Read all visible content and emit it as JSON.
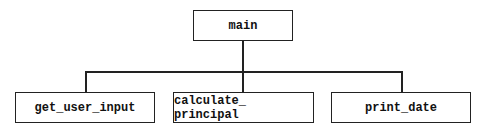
{
  "diagram": {
    "type": "structure-chart",
    "root": {
      "label": "main"
    },
    "children": [
      {
        "label": "get_user_input"
      },
      {
        "label": "calculate_ principal"
      },
      {
        "label": "print_date"
      }
    ]
  }
}
